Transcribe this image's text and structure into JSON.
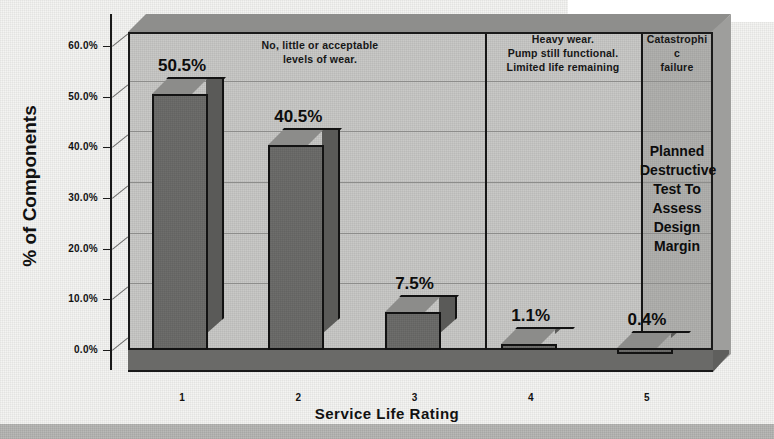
{
  "chart_data": {
    "type": "bar",
    "title": "",
    "xlabel": "Service Life Rating",
    "ylabel": "% of Components",
    "categories": [
      "1",
      "2",
      "3",
      "4",
      "5"
    ],
    "values": [
      50.5,
      40.5,
      7.5,
      1.1,
      0.4
    ],
    "value_labels": [
      "50.5%",
      "40.5%",
      "7.5%",
      "1.1%",
      "0.4%"
    ],
    "ylim": [
      0,
      60
    ],
    "yticks": [
      0,
      10,
      20,
      30,
      40,
      50,
      60
    ],
    "ytick_labels": [
      "0.0%",
      "10.0%",
      "20.0%",
      "30.0%",
      "40.0%",
      "50.0%",
      "60.0%"
    ],
    "grid": true,
    "legend": "none",
    "style": "3d-bar",
    "annotations": [
      {
        "name": "zone-1-3-caption",
        "covers": [
          "1",
          "2",
          "3"
        ],
        "text_lines": [
          "No, little or acceptable",
          "levels of wear."
        ]
      },
      {
        "name": "zone-4-caption",
        "covers": [
          "4"
        ],
        "text_lines": [
          "Heavy wear.",
          "Pump still functional.",
          "Limited life remaining"
        ]
      },
      {
        "name": "zone-5-caption",
        "covers": [
          "5"
        ],
        "text_lines": [
          "Catastrophi",
          "c",
          "failure"
        ]
      },
      {
        "name": "zone-5-note",
        "covers": [
          "5"
        ],
        "text_lines": [
          "Planned",
          "Destructive",
          "Test To",
          "Assess",
          "Design",
          "Margin"
        ]
      }
    ],
    "colors": {
      "bar_face": "#6e6e6c",
      "bar_side": "#5a5a58",
      "bar_top": "#8c8c8a",
      "plot_background": "#c9c9c7",
      "floor": "#6a6a68",
      "axis": "#1a1a1a",
      "gridline": "#8d8d8b",
      "zone5_shade": "#a9a9a7",
      "text": "#111111",
      "page": "#f4f4f2"
    }
  }
}
